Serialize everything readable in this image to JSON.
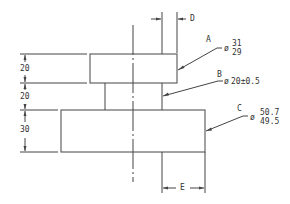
{
  "diagram": {
    "type": "engineering-drawing",
    "colors": {
      "line": "#444444",
      "text": "#333333",
      "background": "#ffffff"
    },
    "vertical_dimensions": [
      {
        "label": "20",
        "feature": "A height"
      },
      {
        "label": "20",
        "feature": "B height"
      },
      {
        "label": "30",
        "feature": "C height"
      }
    ],
    "features": [
      {
        "letter": "A",
        "diameter_symbol": "ø",
        "upper": "31",
        "lower": "29"
      },
      {
        "letter": "B",
        "diameter_symbol": "ø",
        "value": "20±0.5"
      },
      {
        "letter": "C",
        "diameter_symbol": "ø",
        "upper": "50.7",
        "lower": "49.5"
      }
    ],
    "unknown_dimensions": [
      {
        "label": "D",
        "position": "top, between centerline-offset edge and A edge"
      },
      {
        "label": "E",
        "position": "bottom, from B edge to C edge"
      }
    ]
  }
}
